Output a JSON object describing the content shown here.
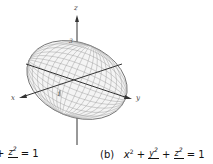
{
  "figure": {
    "type": "3D surface plot",
    "surface": "ellipsoid",
    "axes": {
      "x_label": "x",
      "y_label": "y",
      "z_label": "z"
    },
    "tick_labels": {
      "x_tick": "1",
      "z_tick": "3"
    }
  },
  "captions": {
    "left": {
      "partial_num": "z",
      "partial_num_exp": "2",
      "plus": "+",
      "equals": "= 1"
    },
    "right": {
      "label": "(b)",
      "term1": "x",
      "term1_exp": "2",
      "plus1": "+",
      "frac1_num": "y",
      "frac1_exp": "2",
      "plus2": "+",
      "frac2_num": "z",
      "frac2_exp": "2",
      "equals": "= 1"
    }
  }
}
